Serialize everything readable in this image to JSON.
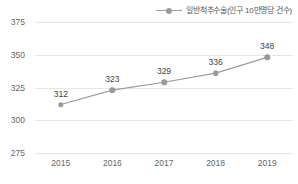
{
  "chart_data": {
    "type": "line",
    "title": "",
    "xlabel": "",
    "ylabel": "",
    "categories": [
      "2015",
      "2016",
      "2017",
      "2018",
      "2019"
    ],
    "series": [
      {
        "name": "일반척추수술(인구 10만명당 건수)",
        "values": [
          312,
          323,
          329,
          336,
          348
        ],
        "color": "#9a9a9a",
        "marker": "circle"
      }
    ],
    "ylim": [
      275,
      375
    ],
    "yticks": [
      "275",
      "300",
      "325",
      "350",
      "375"
    ],
    "ytick_values": [
      275,
      300,
      325,
      350,
      375
    ],
    "grid": "horizontal",
    "legend_position": "top-right",
    "data_labels": [
      "312",
      "323",
      "329",
      "336",
      "348"
    ],
    "point_label_color": "#3f3f3f",
    "gridline_color": "#e6e6e6",
    "tick_label_color": "#666666",
    "background_color": "#ffffff"
  }
}
